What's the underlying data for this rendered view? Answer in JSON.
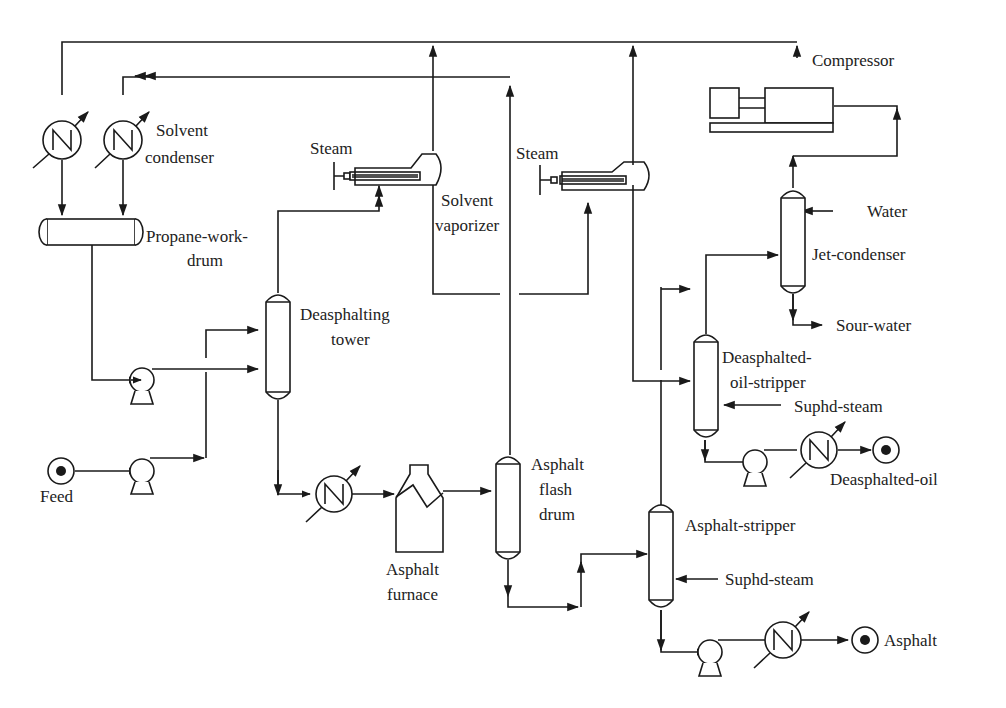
{
  "diagram": {
    "type": "process-flow-diagram",
    "line_color": "#1a1a1a",
    "background": "#ffffff",
    "labels": {
      "compressor": "Compressor",
      "solvent_condenser_1": "Solvent",
      "solvent_condenser_2": "condenser",
      "steam_1": "Steam",
      "steam_2": "Steam",
      "solvent_vaporizer_1": "Solvent",
      "solvent_vaporizer_2": "vaporizer",
      "propane_work_drum_1": "Propane-work-",
      "propane_work_drum_2": "drum",
      "deasphalting_tower_1": "Deasphalting",
      "deasphalting_tower_2": "tower",
      "water": "Water",
      "jet_condenser": "Jet-condenser",
      "sour_water": "Sour-water",
      "deasphalted_oil_stripper_1": "Deasphalted-",
      "deasphalted_oil_stripper_2": "oil-stripper",
      "suphd_steam_1": "Suphd-steam",
      "deasphalted_oil": "Deasphalted-oil",
      "feed": "Feed",
      "asphalt_flash_drum_1": "Asphalt",
      "asphalt_flash_drum_2": "flash",
      "asphalt_flash_drum_3": "drum",
      "asphalt_furnace_1": "Asphalt",
      "asphalt_furnace_2": "furnace",
      "asphalt_stripper": "Asphalt-stripper",
      "suphd_steam_2": "Suphd-steam",
      "asphalt": "Asphalt"
    },
    "equipment": [
      "Compressor",
      "Solvent condenser (x2)",
      "Propane-work-drum",
      "Deasphalting tower",
      "Solvent vaporizer (x2)",
      "Jet-condenser",
      "Deasphalted-oil-stripper",
      "Asphalt furnace",
      "Asphalt flash drum",
      "Asphalt-stripper",
      "Pumps (x4)",
      "Coolers (x3)"
    ],
    "streams": {
      "inputs": [
        "Feed",
        "Steam",
        "Steam",
        "Water",
        "Suphd-steam",
        "Suphd-steam"
      ],
      "outputs": [
        "Sour-water",
        "Deasphalted-oil",
        "Asphalt"
      ]
    }
  }
}
